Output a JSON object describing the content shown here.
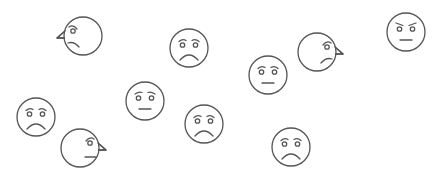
{
  "canvas": {
    "width": 437,
    "height": 178,
    "background": "#ffffff",
    "stroke_color": "#555555"
  },
  "faces": [
    {
      "view": "profile-left",
      "expression": "sad",
      "cx": 83,
      "cy": 36,
      "r": 19
    },
    {
      "view": "frontal",
      "expression": "sad",
      "cx": 189,
      "cy": 48,
      "r": 19
    },
    {
      "view": "frontal",
      "expression": "neutral",
      "cx": 268,
      "cy": 75,
      "r": 19
    },
    {
      "view": "profile-right",
      "expression": "sad",
      "cx": 317,
      "cy": 52,
      "r": 19
    },
    {
      "view": "frontal",
      "expression": "angry",
      "cx": 406,
      "cy": 32,
      "r": 19
    },
    {
      "view": "frontal",
      "expression": "worried",
      "cx": 145,
      "cy": 101,
      "r": 19
    },
    {
      "view": "frontal",
      "expression": "sad",
      "cx": 36,
      "cy": 117,
      "r": 19
    },
    {
      "view": "profile-right",
      "expression": "neutral",
      "cx": 80,
      "cy": 148,
      "r": 19
    },
    {
      "view": "frontal",
      "expression": "sad",
      "cx": 204,
      "cy": 124,
      "r": 19
    },
    {
      "view": "frontal",
      "expression": "sad",
      "cx": 291,
      "cy": 147,
      "r": 19
    }
  ]
}
